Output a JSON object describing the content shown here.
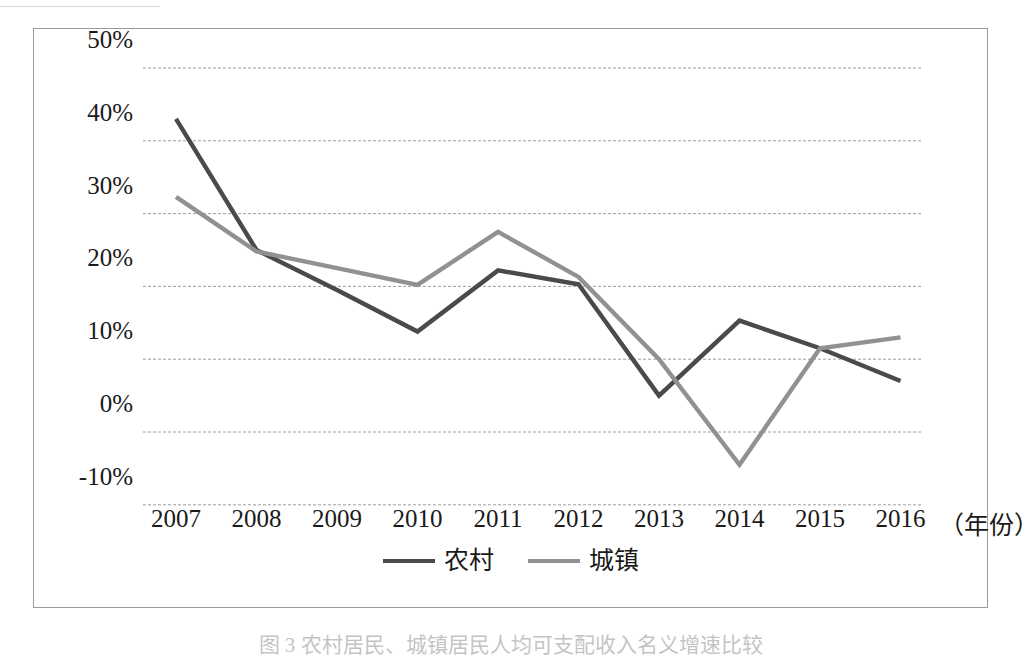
{
  "figure": {
    "caption": "图 3  农村居民、城镇居民人均可支配收入名义增速比较"
  },
  "axes": {
    "y_ticks": [
      "50%",
      "40%",
      "30%",
      "20%",
      "10%",
      "0%",
      "-10%"
    ],
    "x_ticks": [
      "2007",
      "2008",
      "2009",
      "2010",
      "2011",
      "2012",
      "2013",
      "2014",
      "2015",
      "2016"
    ],
    "x_unit": "（年份）"
  },
  "legend": {
    "items": [
      {
        "label": "农村",
        "color": "#4a4a4a"
      },
      {
        "label": "城镇",
        "color": "#919191"
      }
    ]
  },
  "colors": {
    "rural_line": "#4a4a4a",
    "urban_line": "#919191",
    "gridline": "#9e9e9e",
    "frame": "#9a9a9a",
    "text": "#1a1a1a"
  },
  "chart_data": {
    "type": "line",
    "title": "",
    "xlabel": "（年份）",
    "ylabel": "",
    "x": [
      2007,
      2008,
      2009,
      2010,
      2011,
      2012,
      2013,
      2014,
      2015,
      2016
    ],
    "categories": [
      "2007",
      "2008",
      "2009",
      "2010",
      "2011",
      "2012",
      "2013",
      "2014",
      "2015",
      "2016"
    ],
    "ylim": [
      -10,
      50
    ],
    "ytick_values": [
      50,
      40,
      30,
      20,
      10,
      0,
      -10
    ],
    "grid": true,
    "legend_position": "bottom",
    "series": [
      {
        "name": "农村",
        "color": "#4a4a4a",
        "values": [
          43.0,
          25.0,
          19.5,
          13.8,
          22.2,
          20.3,
          5.0,
          15.3,
          11.5,
          7.0
        ]
      },
      {
        "name": "城镇",
        "color": "#919191",
        "values": [
          32.3,
          24.8,
          22.5,
          20.2,
          27.5,
          21.3,
          10.0,
          -4.5,
          11.5,
          13.0
        ]
      }
    ]
  }
}
